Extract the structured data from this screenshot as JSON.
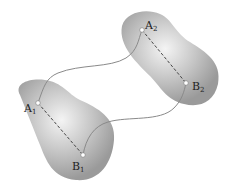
{
  "diagram": {
    "body1": {
      "point_a": {
        "label": "A",
        "sub": "1"
      },
      "point_b": {
        "label": "B",
        "sub": "1"
      }
    },
    "body2": {
      "point_a": {
        "label": "A",
        "sub": "2"
      },
      "point_b": {
        "label": "B",
        "sub": "2"
      }
    },
    "colors": {
      "body_fill": "#9a9a9a",
      "highlight": "#f2f2f2",
      "path": "#8a8a8a",
      "dash": "#333333"
    }
  }
}
